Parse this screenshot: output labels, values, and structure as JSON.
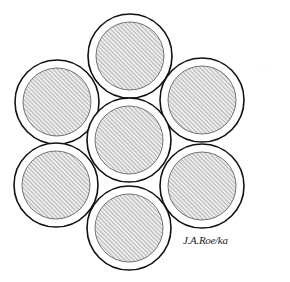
{
  "diagram": {
    "stroke_color": "#111111",
    "hatch_color": "#8a8a8a",
    "hatch_bg": "#ececec",
    "outer_radius": 42,
    "inner_radius": 34,
    "strands": [
      {
        "id": "top",
        "cx": 130,
        "cy": 56
      },
      {
        "id": "upper-left",
        "cx": 57,
        "cy": 102
      },
      {
        "id": "upper-right",
        "cx": 202,
        "cy": 100
      },
      {
        "id": "center",
        "cx": 129,
        "cy": 140
      },
      {
        "id": "lower-left",
        "cx": 56,
        "cy": 185
      },
      {
        "id": "lower-right",
        "cx": 202,
        "cy": 186
      },
      {
        "id": "bottom",
        "cx": 129,
        "cy": 228
      }
    ]
  },
  "signature": {
    "text": "J.A.Roe/ka"
  },
  "watermark": {
    "text": "· · · · · ·"
  }
}
